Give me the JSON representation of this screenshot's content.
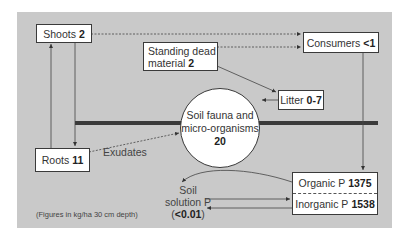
{
  "diagram": {
    "colors": {
      "background": "#c9c9c9",
      "box": "#ffffff",
      "line": "#3a3a3a",
      "soil_bar": "#3a3a3a"
    },
    "nodes": {
      "shoots": {
        "label": "Shoots",
        "value": "2"
      },
      "standing_dead": {
        "label_line1": "Standing dead",
        "label_line2": "material",
        "value": "2"
      },
      "consumers": {
        "label": "Consumers",
        "value": "<1"
      },
      "litter": {
        "label": "Litter",
        "value": "0-7"
      },
      "soil_fauna": {
        "label_line1": "Soil fauna and",
        "label_line2": "micro-organisms",
        "value": "20"
      },
      "roots": {
        "label": "Roots",
        "value": "11"
      },
      "organic_p": {
        "label": "Organic P",
        "value": "1375"
      },
      "inorganic_p": {
        "label": "Inorganic P",
        "value": "1538"
      },
      "soil_solution": {
        "label_line1": "Soil",
        "label_line2": "solution P",
        "value": "<0.01"
      }
    },
    "edge_labels": {
      "exudates": "Exudates"
    },
    "note": "(Figures in kg/ha 30 cm depth)"
  }
}
